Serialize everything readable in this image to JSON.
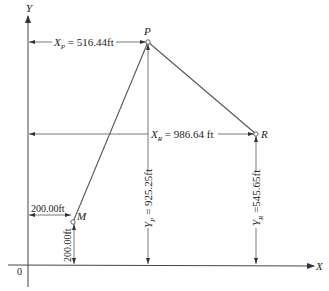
{
  "diagram": {
    "axes": {
      "x_label": "X",
      "y_label": "Y",
      "origin_label": "0"
    },
    "points": [
      {
        "id": "P",
        "label": "P",
        "x_ft": 516.44,
        "y_ft": 925.25
      },
      {
        "id": "R",
        "label": "R",
        "x_ft": 986.64,
        "y_ft": 545.65
      },
      {
        "id": "M",
        "label": "M",
        "x_ft": 200.0,
        "y_ft": 200.0
      }
    ],
    "segments": [
      {
        "from": "M",
        "to": "P"
      },
      {
        "from": "P",
        "to": "R"
      }
    ],
    "dimensions": {
      "xp": {
        "var": "X",
        "sub": "P",
        "value": " = 516.44ft"
      },
      "xr": {
        "var": "X",
        "sub": "R",
        "value": " = 986.64 ft"
      },
      "yp": {
        "var": "Y",
        "sub": "P",
        "value": " = 925.25ft"
      },
      "yr": {
        "var": "Y",
        "sub": "R",
        "value": " =545.65ft"
      },
      "mx": {
        "value": "200.00ft"
      },
      "my": {
        "value": "200.00ft"
      }
    }
  }
}
